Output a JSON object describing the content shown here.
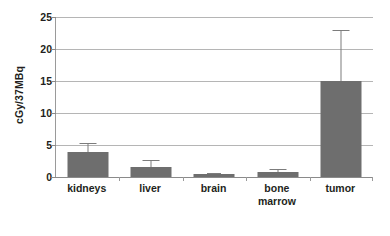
{
  "chart_data": {
    "type": "bar",
    "title": "",
    "xlabel": "",
    "ylabel": "cGy/37MBq",
    "ylim": [
      0,
      25
    ],
    "ytick_values": [
      0,
      5,
      10,
      15,
      20,
      25
    ],
    "ytick_labels": [
      "0",
      "5",
      "10",
      "15",
      "20",
      "25"
    ],
    "grid": true,
    "legend": "none",
    "bar_color": "#6e6e6e",
    "error_bar_color": "#7c7c7c",
    "gridline_color": "#b5b5b5",
    "axis_color": "#8a8a8a",
    "categories": [
      "kidneys",
      "liver",
      "brain",
      "bone marrow",
      "tumor"
    ],
    "category_label_lines": [
      [
        "kidneys"
      ],
      [
        "liver"
      ],
      [
        "brain"
      ],
      [
        "bone",
        "marrow"
      ],
      [
        "tumor"
      ]
    ],
    "values": [
      3.9,
      1.5,
      0.4,
      0.8,
      15.0
    ],
    "error_upper": [
      5.3,
      2.7,
      0.55,
      1.2,
      23.0
    ],
    "error_lower": [
      3.9,
      1.5,
      0.4,
      0.8,
      15.0
    ],
    "series": [
      {
        "name": "dose",
        "values": [
          3.9,
          1.5,
          0.4,
          0.8,
          15.0
        ],
        "error_upper": [
          5.3,
          2.7,
          0.55,
          1.2,
          23.0
        ]
      }
    ]
  }
}
